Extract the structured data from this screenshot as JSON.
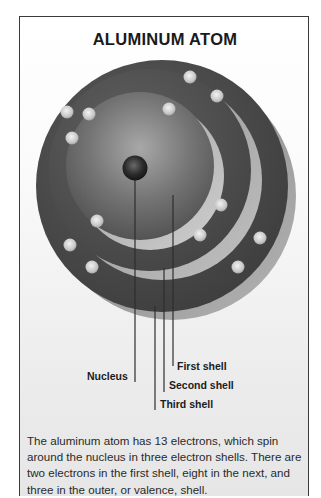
{
  "title": "ALUMINUM ATOM",
  "labels": {
    "nucleus": "Nucleus",
    "first_shell": "First shell",
    "second_shell": "Second shell",
    "third_shell": "Third shell"
  },
  "caption": "The aluminum atom has 13 electrons, which spin around the nucleus in three electron shells. There are two electrons in the first shell, eight in the next, and three in the outer, or valence, shell.",
  "atom": {
    "element": "Aluminum",
    "electron_count": 13,
    "shells": [
      {
        "name": "First shell",
        "electrons": 2
      },
      {
        "name": "Second shell",
        "electrons": 8
      },
      {
        "name": "Third shell",
        "electrons": 3
      }
    ]
  },
  "colors": {
    "shell_dark": "#4a4a4a",
    "shell_light": "#9a9a9a",
    "electron": "#d8d8d8",
    "nucleus": "#2a2a2a",
    "border": "#3a3a3a"
  }
}
